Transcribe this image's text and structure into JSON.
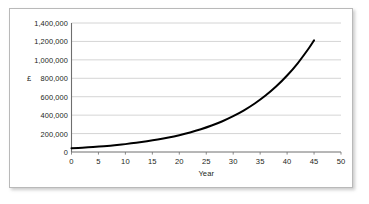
{
  "chart_data": {
    "type": "line",
    "title": "",
    "xlabel": "Year",
    "ylabel": "£",
    "xlim": [
      0,
      50
    ],
    "ylim": [
      0,
      1400000
    ],
    "grid": true,
    "legend": "none",
    "x_ticks": [
      "0",
      "5",
      "10",
      "15",
      "20",
      "25",
      "30",
      "35",
      "40",
      "45",
      "50"
    ],
    "x_tick_values": [
      0,
      5,
      10,
      15,
      20,
      25,
      30,
      35,
      40,
      45,
      50
    ],
    "y_ticks": [
      "0",
      "200,000",
      "400,000",
      "600,000",
      "800,000",
      "1,000,000",
      "1,200,000",
      "1,400,000"
    ],
    "y_tick_values": [
      0,
      200000,
      400000,
      600000,
      800000,
      1000000,
      1200000,
      1400000
    ],
    "series": [
      {
        "name": "Compound growth",
        "color": "#000000",
        "x": [
          0,
          2,
          4,
          6,
          8,
          10,
          12,
          14,
          16,
          18,
          20,
          22,
          24,
          26,
          28,
          30,
          32,
          34,
          36,
          38,
          40,
          42,
          44,
          45
        ],
        "values": [
          40000,
          46600,
          54200,
          63100,
          73400,
          85400,
          99400,
          115700,
          134600,
          156600,
          182300,
          212100,
          246800,
          287200,
          334200,
          388900,
          452500,
          526600,
          612800,
          713100,
          829800,
          965600,
          1123600,
          1211500
        ]
      }
    ],
    "annotations": []
  },
  "figure": {
    "grid_color": "#c9c9c9",
    "axis_color": "#6e6e6e",
    "frame_color": "#b9b9b9",
    "background": "#ffffff"
  }
}
